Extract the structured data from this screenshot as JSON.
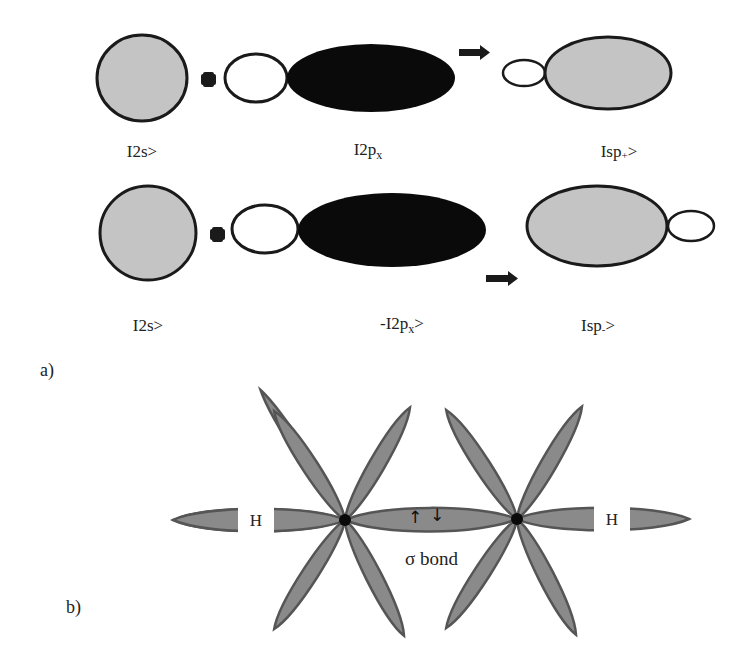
{
  "figure": {
    "part_a": {
      "label": "a)",
      "row1": {
        "term1_label": "I2s>",
        "operator": "+",
        "term2_label_main": "I2p",
        "term2_label_sub": "x",
        "result_label_main": "Isp",
        "result_label_sub": "+",
        "result_label_end": ">"
      },
      "row2": {
        "term1_label": "I2s>",
        "operator": "+",
        "term2_label_main": "-I2p",
        "term2_label_sub": "x",
        "term2_label_end": ">",
        "result_label_main": "Isp",
        "result_label_sub": "-",
        "result_label_end": ">"
      }
    },
    "part_b": {
      "label": "b)",
      "hydrogen_left": "H",
      "hydrogen_right": "H",
      "bond_label": "σ bond",
      "spin_up": "↑",
      "spin_down": "↓"
    },
    "colors": {
      "s_orbital_fill": "#c4c4c4",
      "p_negative_fill": "#0a0a0a",
      "outline": "#1a1a1a",
      "hybrid_lobe_fill": "#8a8a8a",
      "hybrid_lobe_stroke": "#555555"
    }
  }
}
